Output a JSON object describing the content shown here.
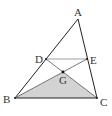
{
  "figure": {
    "type": "geometry-triangle",
    "points": {
      "A": {
        "label": "A"
      },
      "B": {
        "label": "B"
      },
      "C": {
        "label": "C"
      },
      "D": {
        "label": "D"
      },
      "E": {
        "label": "E"
      },
      "G": {
        "label": "G"
      }
    },
    "segments": [
      "AB",
      "AC",
      "BC",
      "DE",
      "DC",
      "EB"
    ],
    "shaded_region": "GBC",
    "colors": {
      "line": "#222222",
      "thin_line": "#888888",
      "shade": "#d3d3d3",
      "point": "#111111"
    }
  }
}
